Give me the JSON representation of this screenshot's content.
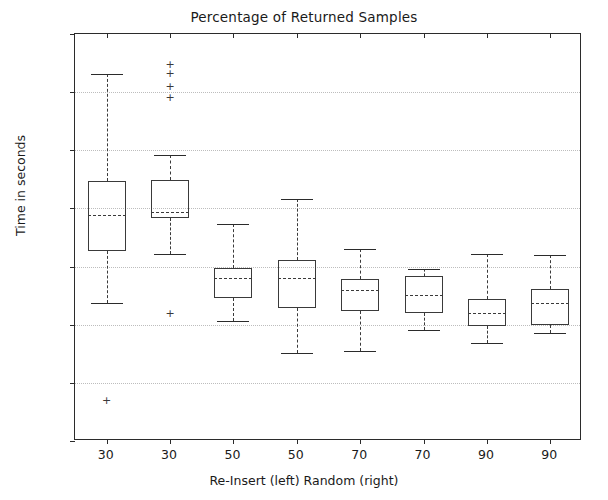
{
  "chart_data": {
    "type": "box",
    "title": "Percentage of Returned Samples",
    "xlabel": "Re-Insert (left)  Random (right)",
    "ylabel": "Time in seconds",
    "ylim": [
      0,
      700
    ],
    "ytick_labels": [
      "0",
      "100",
      "200",
      "300",
      "400",
      "500",
      "600",
      "700"
    ],
    "ytick_values": [
      0,
      100,
      200,
      300,
      400,
      500,
      600,
      700
    ],
    "grid": true,
    "grid_axis": "y",
    "legend": "none",
    "categories": [
      "30",
      "30",
      "50",
      "50",
      "70",
      "70",
      "90",
      "90"
    ],
    "group_order": [
      "Re-Insert",
      "Random",
      "Re-Insert",
      "Random",
      "Re-Insert",
      "Random",
      "Re-Insert",
      "Random"
    ],
    "boxes": [
      {
        "label": "30",
        "group": "Re-Insert",
        "whisker_low": 237,
        "q1": 327,
        "median": 389,
        "q3": 447,
        "whisker_high": 632,
        "fliers": [
          70
        ]
      },
      {
        "label": "30",
        "group": "Random",
        "whisker_low": 322,
        "q1": 384,
        "median": 394,
        "q3": 449,
        "whisker_high": 492,
        "fliers": [
          649,
          633,
          611,
          592,
          220
        ]
      },
      {
        "label": "50",
        "group": "Re-Insert",
        "whisker_low": 207,
        "q1": 246,
        "median": 281,
        "q3": 298,
        "whisker_high": 373,
        "fliers": []
      },
      {
        "label": "50",
        "group": "Random",
        "whisker_low": 152,
        "q1": 229,
        "median": 281,
        "q3": 312,
        "whisker_high": 417,
        "fliers": []
      },
      {
        "label": "70",
        "group": "Re-Insert",
        "whisker_low": 155,
        "q1": 224,
        "median": 260,
        "q3": 279,
        "whisker_high": 331,
        "fliers": []
      },
      {
        "label": "70",
        "group": "Random",
        "whisker_low": 191,
        "q1": 220,
        "median": 251,
        "q3": 284,
        "whisker_high": 296,
        "fliers": []
      },
      {
        "label": "90",
        "group": "Re-Insert",
        "whisker_low": 168,
        "q1": 198,
        "median": 220,
        "q3": 245,
        "whisker_high": 322,
        "fliers": []
      },
      {
        "label": "90",
        "group": "Random",
        "whisker_low": 185,
        "q1": 199,
        "median": 238,
        "q3": 262,
        "whisker_high": 320,
        "fliers": []
      }
    ],
    "colors": {
      "box_edge": "#3a3a3a",
      "median": "#3a3a3a",
      "whisker": "#3a3a3a",
      "cap": "#2b2b2b",
      "flier": "#3a3a3a",
      "grid": "#bdbdbd",
      "axis": "#2b2b2b",
      "background": "#ffffff"
    },
    "flier_marker": "+"
  }
}
